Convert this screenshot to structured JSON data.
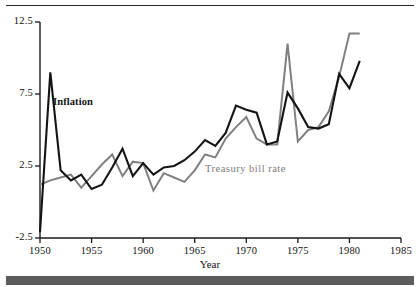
{
  "chart_data": {
    "type": "line",
    "title": "",
    "xlabel": "Year",
    "ylabel": "",
    "xlim": [
      1950,
      1985
    ],
    "ylim": [
      -2.5,
      12.5
    ],
    "xticks": [
      1950,
      1955,
      1960,
      1965,
      1970,
      1975,
      1980,
      1985
    ],
    "yticks": [
      -2.5,
      2.5,
      7.5,
      12.5
    ],
    "xtick_labels": [
      "1950",
      "1955",
      "1960",
      "1965",
      "1970",
      "1975",
      "1980",
      "1985"
    ],
    "ytick_labels": [
      "-2.5",
      "2.5",
      "7.5",
      "12.5"
    ],
    "grid": false,
    "legend": "inline-annotations",
    "x": [
      1950,
      1951,
      1952,
      1953,
      1954,
      1955,
      1956,
      1957,
      1958,
      1959,
      1960,
      1961,
      1962,
      1963,
      1964,
      1965,
      1966,
      1967,
      1968,
      1969,
      1970,
      1971,
      1972,
      1973,
      1974,
      1975,
      1976,
      1977,
      1978,
      1979,
      1980,
      1981
    ],
    "series": [
      {
        "name": "Inflation",
        "color": "#141414",
        "values": [
          -2.1,
          9.0,
          2.2,
          1.5,
          1.9,
          0.9,
          1.2,
          2.4,
          3.7,
          1.8,
          2.7,
          1.9,
          2.4,
          2.5,
          2.9,
          3.5,
          4.3,
          3.9,
          4.8,
          6.7,
          6.4,
          6.2,
          4.0,
          4.2,
          7.6,
          6.5,
          5.2,
          5.1,
          5.4,
          8.9,
          7.9,
          9.8
        ]
      },
      {
        "name": "Treasury bill rate",
        "color": "#808080",
        "values": [
          1.2,
          1.5,
          1.7,
          1.9,
          1.0,
          1.8,
          2.6,
          3.3,
          1.8,
          2.8,
          2.7,
          0.8,
          2.0,
          1.7,
          1.4,
          2.2,
          3.3,
          3.1,
          4.4,
          5.2,
          5.9,
          4.4,
          4.0,
          4.0,
          11.0,
          4.2,
          5.0,
          5.2,
          6.3,
          8.7,
          11.7,
          11.7
        ]
      }
    ],
    "annotations": [
      {
        "name": "inflation-label",
        "text": "Inflation",
        "x_px": 53,
        "y_px": 96
      },
      {
        "name": "treasury-bill-rate-label",
        "text": "Treasury bill rate",
        "x_px": 205,
        "y_px": 163
      }
    ]
  }
}
